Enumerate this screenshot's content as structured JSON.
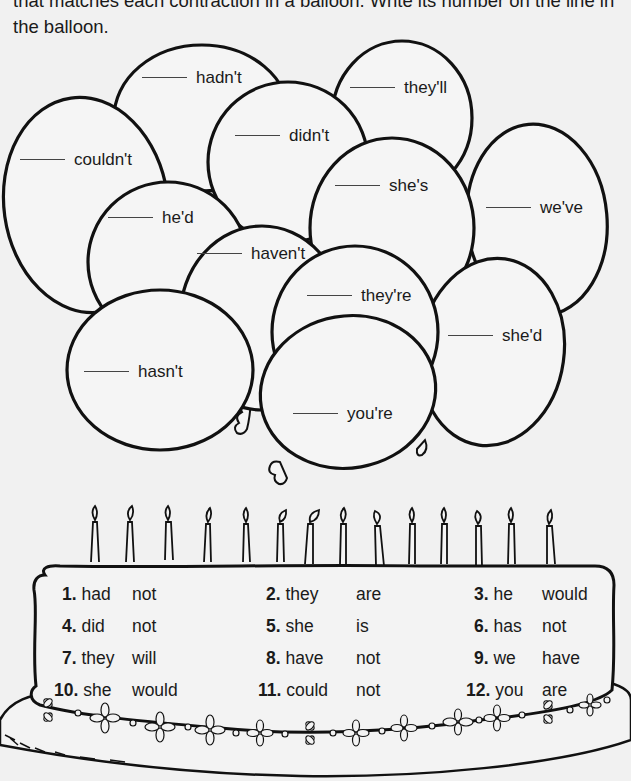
{
  "instructions": {
    "line1": "that matches each contraction in a balloon. Write its number on the line in",
    "line2": "the balloon."
  },
  "balloons": [
    {
      "word": "hadn't",
      "answer": ""
    },
    {
      "word": "they'll",
      "answer": ""
    },
    {
      "word": "didn't",
      "answer": ""
    },
    {
      "word": "couldn't",
      "answer": ""
    },
    {
      "word": "she's",
      "answer": ""
    },
    {
      "word": "we've",
      "answer": ""
    },
    {
      "word": "he'd",
      "answer": ""
    },
    {
      "word": "haven't",
      "answer": ""
    },
    {
      "word": "they're",
      "answer": ""
    },
    {
      "word": "she'd",
      "answer": ""
    },
    {
      "word": "hasn't",
      "answer": ""
    },
    {
      "word": "you're",
      "answer": ""
    }
  ],
  "cake": {
    "candle_count": 14,
    "items": [
      {
        "num": "1.",
        "w1": "had",
        "w2": "not"
      },
      {
        "num": "2.",
        "w1": "they",
        "w2": "are"
      },
      {
        "num": "3.",
        "w1": "he",
        "w2": "would"
      },
      {
        "num": "4.",
        "w1": "did",
        "w2": "not"
      },
      {
        "num": "5.",
        "w1": "she",
        "w2": "is"
      },
      {
        "num": "6.",
        "w1": "has",
        "w2": "not"
      },
      {
        "num": "7.",
        "w1": "they",
        "w2": "will"
      },
      {
        "num": "8.",
        "w1": "have",
        "w2": "not"
      },
      {
        "num": "9.",
        "w1": "we",
        "w2": "have"
      },
      {
        "num": "10.",
        "w1": "she",
        "w2": "would"
      },
      {
        "num": "11.",
        "w1": "could",
        "w2": "not"
      },
      {
        "num": "12.",
        "w1": "you",
        "w2": "are"
      }
    ]
  },
  "colors": {
    "background": "#f1f1f1",
    "ink": "#111111",
    "balloon_fill": "#f5f5f5"
  }
}
